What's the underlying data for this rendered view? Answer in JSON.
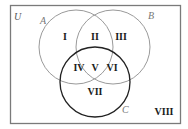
{
  "diagram": {
    "type": "venn-3-set",
    "universe": {
      "label": "U",
      "stroke": "#7a7a7a"
    },
    "sets": [
      {
        "id": "A",
        "label": "A",
        "stroke": "#9a9a9a"
      },
      {
        "id": "B",
        "label": "B",
        "stroke": "#9a9a9a"
      },
      {
        "id": "C",
        "label": "C",
        "stroke": "#222222"
      }
    ],
    "regions": [
      {
        "id": "I",
        "label": "I",
        "description": "A only"
      },
      {
        "id": "II",
        "label": "II",
        "description": "A and B, not C"
      },
      {
        "id": "III",
        "label": "III",
        "description": "B only"
      },
      {
        "id": "IV",
        "label": "IV",
        "description": "A and C, not B"
      },
      {
        "id": "V",
        "label": "V",
        "description": "A and B and C"
      },
      {
        "id": "VI",
        "label": "VI",
        "description": "B and C, not A"
      },
      {
        "id": "VII",
        "label": "VII",
        "description": "C only"
      },
      {
        "id": "VIII",
        "label": "VIII",
        "description": "outside A, B, C"
      }
    ]
  }
}
